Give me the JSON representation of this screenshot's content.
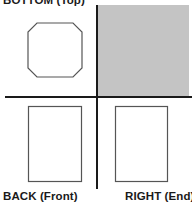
{
  "diagram": {
    "type": "orthographic-projection",
    "labels": {
      "top": "BOTTOM (Top)",
      "back": "BACK (Front)",
      "right": "RIGHT (End)"
    },
    "views": [
      {
        "name": "bottom-top-view",
        "shape": "octagon",
        "quadrant": "top-left"
      },
      {
        "name": "blank-view",
        "shape": "filled-rectangle",
        "quadrant": "top-right",
        "fill": "#c4c4c4"
      },
      {
        "name": "back-front-view",
        "shape": "rectangle",
        "quadrant": "bottom-left"
      },
      {
        "name": "right-end-view",
        "shape": "rectangle",
        "quadrant": "bottom-right"
      }
    ],
    "colors": {
      "line": "#1a1a1a",
      "outline": "#555555",
      "shaded": "#c4c4c4",
      "background": "#ffffff"
    }
  }
}
